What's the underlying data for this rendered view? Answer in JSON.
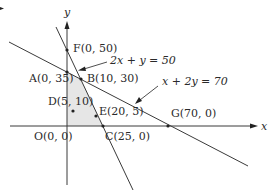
{
  "figure": {
    "axes": {
      "x_label": "x",
      "y_label": "y"
    },
    "constraints": [
      {
        "id": "line1",
        "label": "2x + y = 50"
      },
      {
        "id": "line2",
        "label": "x + 2y = 70"
      }
    ],
    "points": [
      {
        "id": "F",
        "label": "F(0, 50)",
        "x": 0,
        "y": 50
      },
      {
        "id": "A",
        "label": "A(0, 35)",
        "x": 0,
        "y": 35
      },
      {
        "id": "B",
        "label": "B(10, 30)",
        "x": 10,
        "y": 30
      },
      {
        "id": "D",
        "label": "D(5, 10)",
        "x": 5,
        "y": 10
      },
      {
        "id": "E",
        "label": "E(20, 5)",
        "x": 20,
        "y": 5
      },
      {
        "id": "O",
        "label": "O(0, 0)",
        "x": 0,
        "y": 0
      },
      {
        "id": "C",
        "label": "C(25, 0)",
        "x": 25,
        "y": 0
      },
      {
        "id": "G",
        "label": "G(70, 0)",
        "x": 70,
        "y": 0
      }
    ],
    "feasible_region": [
      "O",
      "A",
      "B",
      "C"
    ],
    "colors": {
      "line": "#3a3a3a",
      "region": "#e6e6e6",
      "text": "#2a2a2a"
    }
  }
}
